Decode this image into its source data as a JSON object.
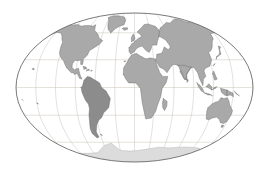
{
  "figure": {
    "name": "world-map",
    "projection": "robinson",
    "width": 271,
    "height": 178,
    "background_color": "#ffffff"
  },
  "map": {
    "ellipse": {
      "center_x": 134.5,
      "center_y": 87.5,
      "radius_x": 118.5,
      "radius_y": 74.5,
      "border_color": "#6b6b6b",
      "border_width": 0.9,
      "ocean_color": "#ffffff"
    },
    "graticule": {
      "meridian_count": 13,
      "meridian_step_degrees": 30,
      "parallel_count": 7,
      "parallel_step_degrees": 30,
      "line_color": "#c9c2b6",
      "line_width": 0.5,
      "visible": true
    },
    "land": {
      "default_fill": "#a9a9a9",
      "default_stroke": "#6e6e6e",
      "stroke_width": 0.45
    },
    "legend_visible": false,
    "labels_visible": false
  },
  "chart_data": {
    "type": "map",
    "subtitle": "",
    "projection": "robinson",
    "xlabel": "Longitude",
    "ylabel": "Latitude",
    "xlim": [
      -180,
      180
    ],
    "ylim": [
      -90,
      90
    ],
    "grid": true,
    "legend": null,
    "colors": {
      "ocean": "#ffffff",
      "land": "#a9a9a9",
      "land_outline": "#6e6e6e",
      "highlight_land": "#8c8c8c",
      "polar_land": "#dcdcdc",
      "graticule": "#c9c2b6",
      "frame": "#6b6b6b"
    },
    "regions": [
      {
        "name": "North America",
        "fill": "#a9a9a9",
        "highlighted": false
      },
      {
        "name": "South America",
        "fill": "#8c8c8c",
        "highlighted": true
      },
      {
        "name": "Europe",
        "fill": "#a9a9a9",
        "highlighted": false
      },
      {
        "name": "Africa",
        "fill": "#a9a9a9",
        "highlighted": false
      },
      {
        "name": "Asia",
        "fill": "#a9a9a9",
        "highlighted": false
      },
      {
        "name": "Australia",
        "fill": "#a9a9a9",
        "highlighted": false
      },
      {
        "name": "Antarctica",
        "fill": "#dcdcdc",
        "highlighted": false
      },
      {
        "name": "Greenland",
        "fill": "#a9a9a9",
        "highlighted": false
      }
    ],
    "graticule_longitudes": [
      -180,
      -150,
      -120,
      -90,
      -60,
      -30,
      0,
      30,
      60,
      90,
      120,
      150,
      180
    ],
    "graticule_latitudes": [
      -90,
      -60,
      -30,
      0,
      30,
      60,
      90
    ],
    "annotations": []
  }
}
